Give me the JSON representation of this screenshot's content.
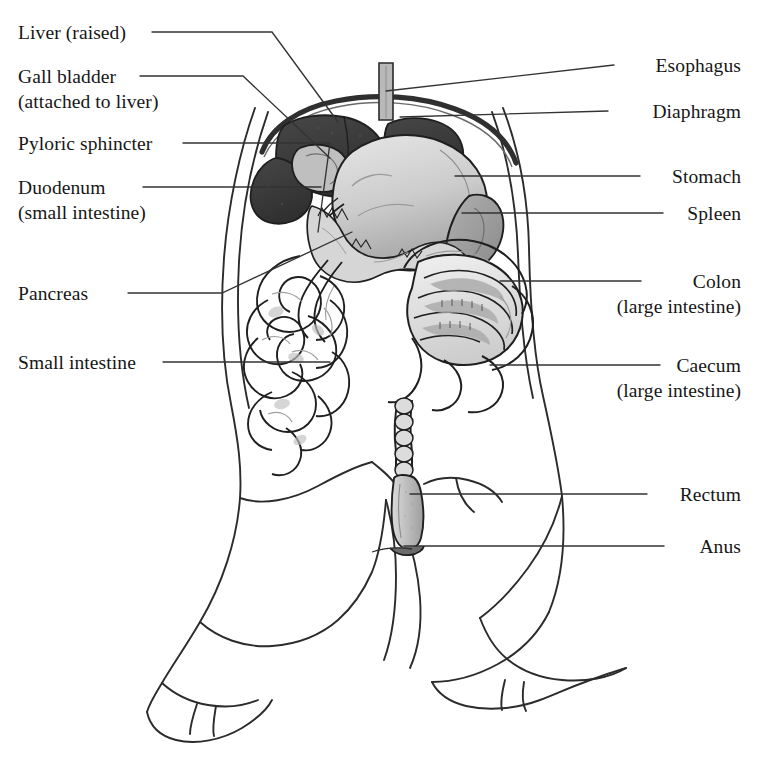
{
  "figure": {
    "colors": {
      "outline": "#2b2b2b",
      "leader": "#333333",
      "liver_dark": "#3c3c3c",
      "liver_mid": "#4a4a4a",
      "stomach_light": "#cfcfcf",
      "stomach_shadow": "#a8a8a8",
      "spleen": "#9a9a9a",
      "pancreas": "#d4d4d4",
      "intestine_fill": "#e2e2e2",
      "intestine_shade": "#b5b5b5",
      "colon_shade": "#a9a9a9",
      "rectum": "#c8c8c8",
      "esophagus": "#b9b9b9",
      "background": "#ffffff"
    }
  },
  "labels": {
    "left": [
      {
        "id": "liver",
        "text": "Liver (raised)",
        "sub": ""
      },
      {
        "id": "gall-bladder",
        "text": "Gall bladder",
        "sub": "(attached to liver)"
      },
      {
        "id": "pyloric-sphincter",
        "text": "Pyloric sphincter",
        "sub": ""
      },
      {
        "id": "duodenum",
        "text": "Duodenum",
        "sub": "(small intestine)"
      },
      {
        "id": "pancreas",
        "text": "Pancreas",
        "sub": ""
      },
      {
        "id": "small-intestine",
        "text": "Small intestine",
        "sub": ""
      }
    ],
    "right": [
      {
        "id": "esophagus",
        "text": "Esophagus",
        "sub": ""
      },
      {
        "id": "diaphragm",
        "text": "Diaphragm",
        "sub": ""
      },
      {
        "id": "stomach",
        "text": "Stomach",
        "sub": ""
      },
      {
        "id": "spleen",
        "text": "Spleen",
        "sub": ""
      },
      {
        "id": "colon",
        "text": "Colon",
        "sub": "(large intestine)"
      },
      {
        "id": "caecum",
        "text": "Caecum",
        "sub": "(large intestine)"
      },
      {
        "id": "rectum",
        "text": "Rectum",
        "sub": ""
      },
      {
        "id": "anus",
        "text": "Anus",
        "sub": ""
      }
    ]
  }
}
